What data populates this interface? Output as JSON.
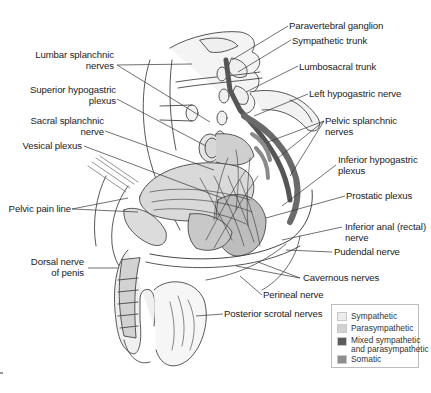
{
  "figure": {
    "labels_left": [
      {
        "id": "lumbar_splanchnic",
        "lines": [
          "Lumbar splanchnic",
          "nerves"
        ]
      },
      {
        "id": "superior_hypogastric",
        "lines": [
          "Superior hypogastric",
          "plexus"
        ]
      },
      {
        "id": "sacral_splanchnic",
        "lines": [
          "Sacral splanchnic",
          "nerve"
        ]
      },
      {
        "id": "vesical_plexus",
        "lines": [
          "Vesical plexus"
        ]
      },
      {
        "id": "pelvic_pain_line",
        "lines": [
          "Pelvic pain line"
        ]
      },
      {
        "id": "dorsal_nerve_penis",
        "lines": [
          "Dorsal nerve",
          "of penis"
        ]
      }
    ],
    "labels_right": [
      {
        "id": "paravertebral_ganglion",
        "lines": [
          "Paravertebral ganglion"
        ]
      },
      {
        "id": "sympathetic_trunk",
        "lines": [
          "Sympathetic trunk"
        ]
      },
      {
        "id": "lumbosacral_trunk",
        "lines": [
          "Lumbosacral trunk"
        ]
      },
      {
        "id": "left_hypogastric",
        "lines": [
          "Left hypogastric nerve"
        ]
      },
      {
        "id": "pelvic_splanchnic",
        "lines": [
          "Pelvic splanchnic",
          "nerves"
        ]
      },
      {
        "id": "inferior_hypogastric",
        "lines": [
          "Inferior hypogastric",
          "plexus"
        ]
      },
      {
        "id": "prostatic_plexus",
        "lines": [
          "Prostatic plexus"
        ]
      },
      {
        "id": "inferior_anal",
        "lines": [
          "Inferior anal (rectal)",
          "nerve"
        ]
      },
      {
        "id": "pudendal",
        "lines": [
          "Pudendal nerve"
        ]
      },
      {
        "id": "cavernous",
        "lines": [
          "Cavernous nerves"
        ]
      },
      {
        "id": "perineal",
        "lines": [
          "Perineal nerve"
        ]
      },
      {
        "id": "posterior_scrotal",
        "lines": [
          "Posterior scrotal nerves"
        ]
      }
    ]
  },
  "legend": {
    "items": [
      {
        "label": "Sympathetic",
        "line2": "",
        "color": "#ececec"
      },
      {
        "label": "Parasympathetic",
        "line2": "",
        "color": "#d2d2d2"
      },
      {
        "label": "Mixed sympathetic",
        "line2": "and parasympathetic",
        "color": "#5a5a5a"
      },
      {
        "label": "Somatic",
        "line2": "",
        "color": "#8e8e8e"
      }
    ]
  },
  "text": {
    "l0a": "Lumbar splanchnic",
    "l0b": "nerves",
    "l1a": "Superior hypogastric",
    "l1b": "plexus",
    "l2a": "Sacral splanchnic",
    "l2b": "nerve",
    "l3a": "Vesical plexus",
    "l4a": "Pelvic pain line",
    "l5a": "Dorsal nerve",
    "l5b": "of penis",
    "r0a": "Paravertebral ganglion",
    "r1a": "Sympathetic trunk",
    "r2a": "Lumbosacral trunk",
    "r3a": "Left hypogastric nerve",
    "r4a": "Pelvic splanchnic",
    "r4b": "nerves",
    "r5a": "Inferior hypogastric",
    "r5b": "plexus",
    "r6a": "Prostatic plexus",
    "r7a": "Inferior anal (rectal)",
    "r7b": "nerve",
    "r8a": "Pudendal nerve",
    "r9a": "Cavernous nerves",
    "r10a": "Perineal nerve",
    "r11a": "Posterior scrotal nerves"
  }
}
